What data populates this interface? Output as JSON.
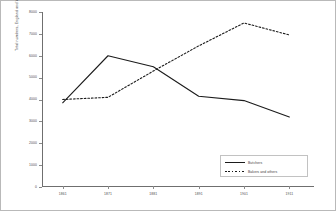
{
  "chart_data": {
    "type": "line",
    "title": "",
    "xlabel": "",
    "ylabel": "Total numbers, England and Wales",
    "ylim": [
      0,
      8000
    ],
    "ystep": 1000,
    "grid": false,
    "legend_position": "bottom-right",
    "categories": [
      "1861",
      "1871",
      "1881",
      "1891",
      "1901",
      "1911"
    ],
    "yticks": [
      "0",
      "1000",
      "2000",
      "3000",
      "4000",
      "5000",
      "6000",
      "7000",
      "8000"
    ],
    "ytick_values": [
      0,
      1000,
      2000,
      3000,
      4000,
      5000,
      6000,
      7000,
      8000
    ],
    "series": [
      {
        "name": "Butchers",
        "style": "solid",
        "color": "#1b1b1b",
        "values": [
          3850,
          6000,
          5500,
          4150,
          3950,
          3200
        ]
      },
      {
        "name": "Bakers and others",
        "style": "dotted",
        "color": "#1b1b1b",
        "values": [
          4000,
          4100,
          5300,
          6450,
          7500,
          6950
        ]
      }
    ]
  },
  "legend": {
    "entries": [
      {
        "label": "Butchers"
      },
      {
        "label": "Bakers and others"
      }
    ]
  }
}
